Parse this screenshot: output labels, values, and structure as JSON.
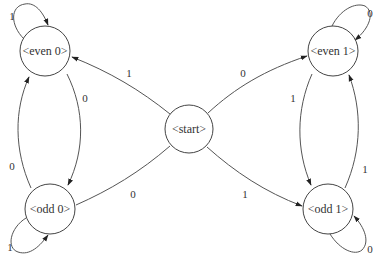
{
  "diagram": {
    "type": "finite-state-machine",
    "nodes": [
      {
        "id": "start",
        "label": "<start>"
      },
      {
        "id": "even0",
        "label": "<even 0>"
      },
      {
        "id": "odd0",
        "label": "<odd 0>"
      },
      {
        "id": "even1",
        "label": "<even 1>"
      },
      {
        "id": "odd1",
        "label": "<odd 1>"
      }
    ],
    "edges": [
      {
        "from": "start",
        "to": "even0",
        "label": "1"
      },
      {
        "from": "start",
        "to": "even1",
        "label": "0"
      },
      {
        "from": "start",
        "to": "odd0",
        "label": "0"
      },
      {
        "from": "start",
        "to": "odd1",
        "label": "1"
      },
      {
        "from": "even0",
        "to": "even0",
        "label": "1"
      },
      {
        "from": "even0",
        "to": "odd0",
        "label": "0"
      },
      {
        "from": "odd0",
        "to": "even0",
        "label": "0"
      },
      {
        "from": "odd0",
        "to": "odd0",
        "label": "1"
      },
      {
        "from": "even1",
        "to": "even1",
        "label": "0"
      },
      {
        "from": "even1",
        "to": "odd1",
        "label": "1"
      },
      {
        "from": "odd1",
        "to": "even1",
        "label": "1"
      },
      {
        "from": "odd1",
        "to": "odd1",
        "label": "0"
      }
    ]
  }
}
